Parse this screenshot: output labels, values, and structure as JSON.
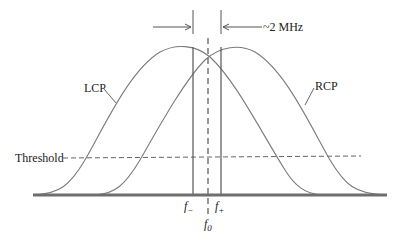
{
  "diagram": {
    "type": "overlapping-frequency-response-curves",
    "curves": [
      {
        "name": "LCP",
        "label": "LCP",
        "peak_frequency_label": "f−"
      },
      {
        "name": "RCP",
        "label": "RCP",
        "peak_frequency_label": "f+"
      }
    ],
    "threshold_label": "Threshold",
    "separation_label": "~2 MHz",
    "frequency_labels": {
      "f_minus": "f",
      "f_minus_sub": "−",
      "f_plus": "f",
      "f_plus_sub": "+",
      "f_zero": "f",
      "f_zero_sub": "0"
    },
    "colors": {
      "curve": "#7a7a7a",
      "baseline": "#6e6e6e",
      "markers": "#555555",
      "text": "#222222"
    }
  }
}
